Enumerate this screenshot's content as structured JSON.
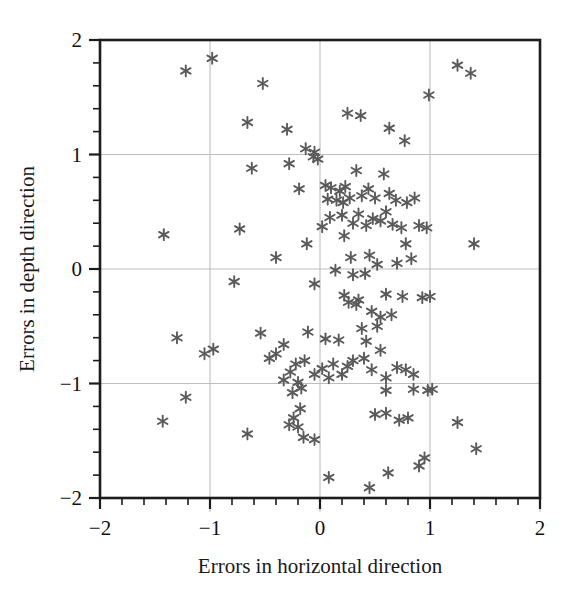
{
  "chart_data": {
    "type": "scatter",
    "title": "",
    "xlabel": "Errors in horizontal direction",
    "ylabel": "Errors in depth direction",
    "xlim": [
      -2,
      2
    ],
    "ylim": [
      -2,
      2
    ],
    "xticks": [
      -2,
      -1,
      0,
      1,
      2
    ],
    "yticks": [
      -2,
      -1,
      0,
      1,
      2
    ],
    "xtick_labels": [
      "-2",
      "-1",
      "0",
      "1",
      "2"
    ],
    "ytick_labels": [
      "-2",
      "-1",
      "0",
      "1",
      "2"
    ],
    "minor_ticks_per_interval": 5,
    "grid": true,
    "grid_color": "#bdbdbd",
    "legend": null,
    "marker": "asterisk-6-point",
    "marker_color": "#5a5a5a",
    "marker_size": 11,
    "frame_color": "#1c1c1c",
    "background": "#ffffff",
    "n_points": 133,
    "points": [
      [
        -0.98,
        1.84
      ],
      [
        -1.22,
        1.73
      ],
      [
        1.25,
        1.78
      ],
      [
        1.37,
        1.71
      ],
      [
        -0.52,
        1.62
      ],
      [
        0.99,
        1.52
      ],
      [
        -0.66,
        1.28
      ],
      [
        0.37,
        1.34
      ],
      [
        -0.3,
        1.22
      ],
      [
        0.63,
        1.23
      ],
      [
        0.25,
        1.36
      ],
      [
        -0.13,
        1.05
      ],
      [
        -0.06,
        0.98
      ],
      [
        -0.02,
        0.96
      ],
      [
        -0.28,
        0.92
      ],
      [
        0.77,
        1.12
      ],
      [
        -0.05,
        1.02
      ],
      [
        0.33,
        0.86
      ],
      [
        0.58,
        0.83
      ],
      [
        -0.19,
        0.7
      ],
      [
        0.05,
        0.73
      ],
      [
        0.1,
        0.71
      ],
      [
        0.23,
        0.72
      ],
      [
        0.18,
        0.68
      ],
      [
        0.44,
        0.7
      ],
      [
        0.27,
        0.62
      ],
      [
        0.15,
        0.6
      ],
      [
        0.21,
        0.58
      ],
      [
        0.07,
        0.61
      ],
      [
        0.38,
        0.64
      ],
      [
        0.5,
        0.62
      ],
      [
        0.63,
        0.66
      ],
      [
        0.69,
        0.6
      ],
      [
        0.79,
        0.58
      ],
      [
        0.86,
        0.62
      ],
      [
        -1.42,
        0.3
      ],
      [
        -0.73,
        0.35
      ],
      [
        0.3,
        0.4
      ],
      [
        0.42,
        0.38
      ],
      [
        0.55,
        0.42
      ],
      [
        0.66,
        0.39
      ],
      [
        0.74,
        0.36
      ],
      [
        0.9,
        0.38
      ],
      [
        0.97,
        0.36
      ],
      [
        1.4,
        0.22
      ],
      [
        -0.12,
        0.22
      ],
      [
        0.09,
        0.45
      ],
      [
        0.2,
        0.47
      ],
      [
        0.35,
        0.48
      ],
      [
        0.48,
        0.44
      ],
      [
        0.6,
        0.5
      ],
      [
        -0.4,
        0.1
      ],
      [
        0.28,
        0.1
      ],
      [
        0.45,
        0.12
      ],
      [
        0.52,
        0.04
      ],
      [
        0.7,
        0.05
      ],
      [
        0.83,
        0.09
      ],
      [
        -0.78,
        -0.11
      ],
      [
        -0.05,
        -0.13
      ],
      [
        0.14,
        -0.01
      ],
      [
        0.3,
        -0.05
      ],
      [
        0.41,
        -0.04
      ],
      [
        0.22,
        -0.23
      ],
      [
        0.26,
        -0.29
      ],
      [
        0.33,
        -0.31
      ],
      [
        0.35,
        -0.27
      ],
      [
        0.6,
        -0.22
      ],
      [
        0.75,
        -0.24
      ],
      [
        0.93,
        -0.25
      ],
      [
        1.0,
        -0.24
      ],
      [
        0.47,
        -0.37
      ],
      [
        0.55,
        -0.42
      ],
      [
        0.65,
        -0.4
      ],
      [
        0.38,
        -0.52
      ],
      [
        -1.3,
        -0.6
      ],
      [
        -1.05,
        -0.74
      ],
      [
        -0.97,
        -0.7
      ],
      [
        -0.54,
        -0.56
      ],
      [
        -0.33,
        -0.66
      ],
      [
        0.17,
        -0.62
      ],
      [
        0.05,
        -0.61
      ],
      [
        0.42,
        -0.63
      ],
      [
        -0.11,
        -0.55
      ],
      [
        0.55,
        -0.71
      ],
      [
        0.3,
        -0.8
      ],
      [
        0.4,
        -0.78
      ],
      [
        0.25,
        -0.85
      ],
      [
        0.12,
        -0.83
      ],
      [
        0.02,
        -0.87
      ],
      [
        -0.22,
        -0.83
      ],
      [
        -0.14,
        -0.8
      ],
      [
        -0.46,
        -0.78
      ],
      [
        -0.27,
        -0.9
      ],
      [
        -0.05,
        -0.92
      ],
      [
        0.08,
        -0.95
      ],
      [
        0.7,
        -0.86
      ],
      [
        0.78,
        -0.88
      ],
      [
        0.85,
        -0.92
      ],
      [
        -0.33,
        -0.97
      ],
      [
        -0.2,
        -0.99
      ],
      [
        0.2,
        -0.92
      ],
      [
        0.47,
        -0.88
      ],
      [
        0.6,
        -0.95
      ],
      [
        -1.22,
        -1.12
      ],
      [
        -0.25,
        -1.08
      ],
      [
        -0.17,
        -1.04
      ],
      [
        0.6,
        -1.06
      ],
      [
        0.85,
        -1.05
      ],
      [
        0.98,
        -1.06
      ],
      [
        1.02,
        -1.05
      ],
      [
        -1.43,
        -1.33
      ],
      [
        -0.66,
        -1.44
      ],
      [
        -0.18,
        -1.22
      ],
      [
        -0.24,
        -1.3
      ],
      [
        -0.2,
        -1.38
      ],
      [
        -0.28,
        -1.36
      ],
      [
        0.5,
        -1.27
      ],
      [
        0.6,
        -1.26
      ],
      [
        0.72,
        -1.32
      ],
      [
        0.8,
        -1.3
      ],
      [
        1.25,
        -1.34
      ],
      [
        -0.15,
        -1.47
      ],
      [
        -0.05,
        -1.49
      ],
      [
        0.95,
        -1.65
      ],
      [
        1.42,
        -1.57
      ],
      [
        0.08,
        -1.82
      ],
      [
        0.45,
        -1.91
      ],
      [
        0.62,
        -1.78
      ],
      [
        0.9,
        -1.72
      ],
      [
        -0.4,
        -0.74
      ],
      [
        0.52,
        -0.5
      ],
      [
        0.22,
        0.29
      ],
      [
        0.78,
        0.22
      ],
      [
        -0.62,
        0.88
      ],
      [
        0.02,
        0.37
      ]
    ]
  },
  "axis": {
    "x_title": "Errors in horizontal direction",
    "y_title": "Errors in depth direction"
  }
}
